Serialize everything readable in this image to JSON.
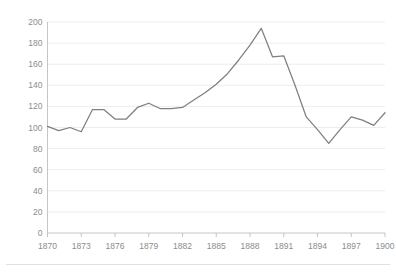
{
  "chart_data": {
    "type": "line",
    "title": "",
    "subtitle": "",
    "xlabel": "",
    "ylabel": "",
    "xlim": [
      1870,
      1900
    ],
    "ylim": [
      0,
      200
    ],
    "grid": true,
    "grid_axis": "y",
    "legend": false,
    "legend_position": "none",
    "markers": false,
    "line_color": "#7f7f7f",
    "background_color": "#ffffff",
    "gridline_color": "#e9e9e9",
    "axis_color": "#bfbfbf",
    "tick_label_color": "#8c8c8c",
    "y_ticks": [
      0,
      20,
      40,
      60,
      80,
      100,
      120,
      140,
      160,
      180,
      200
    ],
    "y_tick_labels": [
      "0",
      "20",
      "40",
      "60",
      "80",
      "100",
      "120",
      "140",
      "160",
      "180",
      "200"
    ],
    "y_tick_step": 20,
    "x_ticks": [
      1870,
      1873,
      1876,
      1879,
      1882,
      1885,
      1888,
      1891,
      1894,
      1897,
      1900
    ],
    "x_tick_labels": [
      "1870",
      "1873",
      "1876",
      "1879",
      "1882",
      "1885",
      "1888",
      "1891",
      "1894",
      "1897",
      "1900"
    ],
    "x_tick_step": 3,
    "x": [
      1870,
      1871,
      1872,
      1873,
      1874,
      1875,
      1876,
      1877,
      1878,
      1879,
      1880,
      1881,
      1882,
      1883,
      1884,
      1885,
      1886,
      1887,
      1888,
      1889,
      1890,
      1891,
      1892,
      1893,
      1894,
      1895,
      1896,
      1897,
      1898,
      1899,
      1900
    ],
    "values": [
      101,
      97,
      100,
      96,
      117,
      117,
      108,
      108,
      119,
      123,
      118,
      118,
      119,
      126,
      133,
      141,
      151,
      164,
      178,
      194,
      167,
      168,
      140,
      110,
      98,
      85,
      98,
      110,
      107,
      102,
      114
    ],
    "series": [
      {
        "name": "series-1",
        "color": "#7f7f7f",
        "values": [
          101,
          97,
          100,
          96,
          117,
          117,
          108,
          108,
          119,
          123,
          118,
          118,
          119,
          126,
          133,
          141,
          151,
          164,
          178,
          194,
          167,
          168,
          140,
          110,
          98,
          85,
          98,
          110,
          107,
          102,
          114
        ]
      }
    ],
    "annotations": [],
    "peak": {
      "x": 1889,
      "y": 194
    },
    "trough": {
      "x": 1895,
      "y": 85
    }
  }
}
